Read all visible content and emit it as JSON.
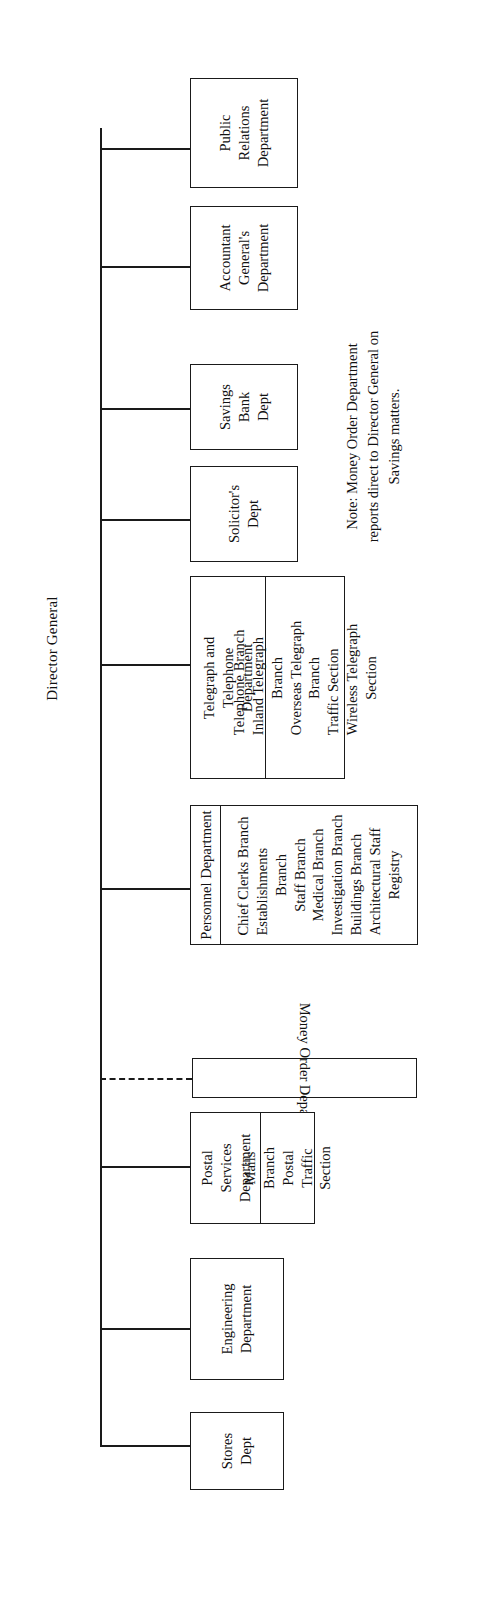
{
  "chart": {
    "title": "Director General",
    "orientation": "rotated-90-ccw",
    "note": "Note: Money Order Department reports direct to Director General on Savings matters.",
    "nodes": [
      {
        "id": "public-relations",
        "label": "Public\nRelations\nDepartment",
        "label_lines": [
          "Public",
          "Relations",
          "Department"
        ]
      },
      {
        "id": "accountant-general",
        "label": "Accountant\nGeneral's\nDepartment",
        "label_lines": [
          "Accountant",
          "General's",
          "Department"
        ]
      },
      {
        "id": "savings-bank",
        "label": "Savings\nBank\nDept",
        "label_lines": [
          "Savings",
          "Bank",
          "Dept"
        ]
      },
      {
        "id": "solicitors",
        "label": "Solicitor's\nDept",
        "label_lines": [
          "Solicitor's",
          "Dept"
        ]
      },
      {
        "id": "telegraph-telephone",
        "label": "Telegraph and\nTelephone\nDepartment",
        "label_lines": [
          "Telegraph and",
          "Telephone",
          "Department"
        ]
      },
      {
        "id": "personnel",
        "label": "Personnel Department",
        "label_lines": [
          "Personnel Department"
        ]
      },
      {
        "id": "money-order",
        "label": "Money Order Department",
        "label_lines": [
          "Money Order Department"
        ]
      },
      {
        "id": "postal-services",
        "label": "Postal\nServices\nDepartment",
        "label_lines": [
          "Postal",
          "Services",
          "Department"
        ]
      },
      {
        "id": "engineering",
        "label": "Engineering\nDepartment",
        "label_lines": [
          "Engineering",
          "Department"
        ]
      },
      {
        "id": "stores",
        "label": "Stores\nDept",
        "label_lines": [
          "Stores",
          "Dept"
        ]
      }
    ],
    "telegraph_branches": [
      "Telephone Branch",
      "Inland Telegraph",
      "Branch",
      "Overseas Telegraph",
      "Branch",
      "Traffic Section",
      "Wireless Telegraph",
      "Section"
    ],
    "personnel_branches": [
      "Chief Clerks Branch",
      "Establishments",
      "Branch",
      "Staff Branch",
      "Medical Branch",
      "Investigation Branch",
      "Buildings Branch",
      "Architectural Staff",
      "Registry"
    ],
    "postal_branches": [
      "Mails",
      "Branch",
      "Postal",
      "Traffic",
      "Section"
    ]
  }
}
